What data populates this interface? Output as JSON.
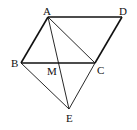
{
  "diagram": {
    "type": "geometry",
    "points": {
      "A": {
        "label": "A",
        "x": 48,
        "y": 17
      },
      "D": {
        "label": "D",
        "x": 122,
        "y": 17
      },
      "B": {
        "label": "B",
        "x": 21,
        "y": 63
      },
      "C": {
        "label": "C",
        "x": 95,
        "y": 63
      },
      "M": {
        "label": "M",
        "x": 58,
        "y": 63
      },
      "E": {
        "label": "E",
        "x": 69,
        "y": 109
      }
    },
    "thick_segments": [
      "AD",
      "AB",
      "BC",
      "CD"
    ],
    "thin_segments": [
      "AC",
      "AE",
      "BE",
      "CE"
    ]
  }
}
